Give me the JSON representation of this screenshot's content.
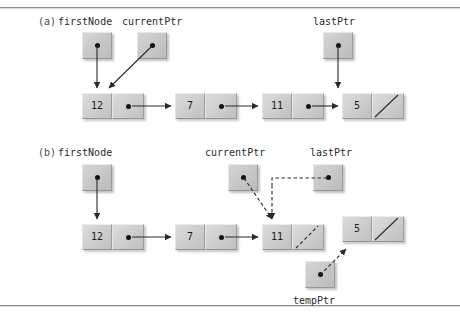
{
  "figure": {
    "part_labels": [
      {
        "id": "a",
        "text": "(a)"
      },
      {
        "id": "b",
        "text": "(b)"
      }
    ]
  },
  "colors": {
    "rule": "#8d8f92",
    "box_face": "#cbcbcb",
    "box_highlight": "#ededed",
    "box_shade": "#969696",
    "ink": "#1d1d1d",
    "arrow": "#2a2a2a",
    "page_background": "#ffffff"
  },
  "part_a": {
    "label": "(a)",
    "pointers": [
      {
        "name": "firstNode",
        "label": "firstNode",
        "x": 82,
        "y": 32,
        "label_x": 58,
        "label_y": 16
      },
      {
        "name": "currentPtr",
        "label": "currentPtr",
        "x": 137,
        "y": 32,
        "label_x": 122,
        "label_y": 16
      },
      {
        "name": "lastPtr",
        "label": "lastPtr",
        "x": 323,
        "y": 32,
        "label_x": 313,
        "label_y": 16
      }
    ],
    "nodes": [
      {
        "value": "12",
        "x": 82,
        "y": 93,
        "link": "dot"
      },
      {
        "value": "7",
        "x": 175,
        "y": 93,
        "link": "dot"
      },
      {
        "value": "11",
        "x": 262,
        "y": 93,
        "link": "dot"
      },
      {
        "value": "5",
        "x": 342,
        "y": 93,
        "link": "null"
      }
    ]
  },
  "part_b": {
    "label": "(b)",
    "pointers": [
      {
        "name": "firstNode",
        "label": "firstNode",
        "x": 82,
        "y": 164,
        "label_x": 58,
        "label_y": 147
      },
      {
        "name": "currentPtr",
        "label": "currentPtr",
        "x": 228,
        "y": 164,
        "label_x": 205,
        "label_y": 147
      },
      {
        "name": "lastPtr",
        "label": "lastPtr",
        "x": 313,
        "y": 164,
        "label_x": 310,
        "label_y": 147
      },
      {
        "name": "tempPtr",
        "label": "tempPtr",
        "x": 305,
        "y": 261,
        "label_x": 293,
        "label_y": 295
      }
    ],
    "nodes": [
      {
        "value": "12",
        "x": 82,
        "y": 224,
        "link": "dot"
      },
      {
        "value": "7",
        "x": 175,
        "y": 224,
        "link": "dot"
      },
      {
        "value": "11",
        "x": 262,
        "y": 224,
        "link": "crossed"
      },
      {
        "value": "5",
        "x": 342,
        "y": 216,
        "link": "null"
      }
    ]
  }
}
